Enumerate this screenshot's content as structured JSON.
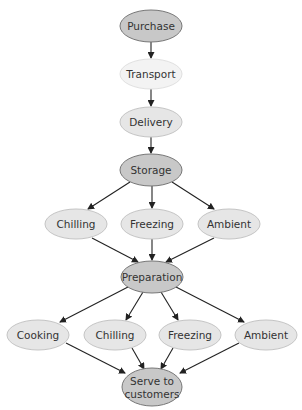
{
  "diagram": {
    "colors": {
      "dark_fill": "#c8c8c8",
      "light_fill": "#e6e6e6",
      "pale_fill": "#f3f3f3",
      "stroke_dark": "#777777",
      "stroke_light": "#c4c4c4",
      "stroke_pale": "#e0e0e0",
      "arrow": "#222222",
      "text": "#333333"
    },
    "nodes": [
      {
        "id": "purchase",
        "label": "Purchase",
        "cx": 151,
        "cy": 26,
        "rx": 31,
        "ry": 16,
        "style": "dark"
      },
      {
        "id": "transport",
        "label": "Transport",
        "cx": 151,
        "cy": 74,
        "rx": 31,
        "ry": 15,
        "style": "pale"
      },
      {
        "id": "delivery",
        "label": "Delivery",
        "cx": 151,
        "cy": 122,
        "rx": 31,
        "ry": 15,
        "style": "light"
      },
      {
        "id": "storage",
        "label": "Storage",
        "cx": 151,
        "cy": 170,
        "rx": 31,
        "ry": 16,
        "style": "dark"
      },
      {
        "id": "chilling1",
        "label": "Chilling",
        "cx": 76,
        "cy": 224,
        "rx": 31,
        "ry": 15,
        "style": "light"
      },
      {
        "id": "freezing1",
        "label": "Freezing",
        "cx": 152,
        "cy": 224,
        "rx": 31,
        "ry": 15,
        "style": "light"
      },
      {
        "id": "ambient1",
        "label": "Ambient",
        "cx": 229,
        "cy": 224,
        "rx": 31,
        "ry": 15,
        "style": "light"
      },
      {
        "id": "preparation",
        "label": "Preparation",
        "cx": 152,
        "cy": 277,
        "rx": 31,
        "ry": 16,
        "style": "dark"
      },
      {
        "id": "cooking",
        "label": "Cooking",
        "cx": 38,
        "cy": 335,
        "rx": 31,
        "ry": 15,
        "style": "light"
      },
      {
        "id": "chilling2",
        "label": "Chilling",
        "cx": 115,
        "cy": 335,
        "rx": 31,
        "ry": 15,
        "style": "light"
      },
      {
        "id": "freezing2",
        "label": "Freezing",
        "cx": 190,
        "cy": 335,
        "rx": 31,
        "ry": 15,
        "style": "light"
      },
      {
        "id": "ambient2",
        "label": "Ambient",
        "cx": 266,
        "cy": 335,
        "rx": 31,
        "ry": 15,
        "style": "light"
      },
      {
        "id": "serve",
        "label": "Serve to",
        "label2": "customers",
        "cx": 152,
        "cy": 387,
        "rx": 30,
        "ry": 19,
        "style": "dark"
      }
    ],
    "edges": [
      {
        "from": "purchase",
        "to": "transport",
        "x1": 151,
        "y1": 42,
        "x2": 151,
        "y2": 58
      },
      {
        "from": "transport",
        "to": "delivery",
        "x1": 151,
        "y1": 89,
        "x2": 151,
        "y2": 106
      },
      {
        "from": "delivery",
        "to": "storage",
        "x1": 151,
        "y1": 137,
        "x2": 151,
        "y2": 153
      },
      {
        "from": "storage",
        "to": "chilling1",
        "x1": 130,
        "y1": 182,
        "x2": 88,
        "y2": 209
      },
      {
        "from": "storage",
        "to": "freezing1",
        "x1": 152,
        "y1": 186,
        "x2": 152,
        "y2": 208
      },
      {
        "from": "storage",
        "to": "ambient1",
        "x1": 172,
        "y1": 182,
        "x2": 214,
        "y2": 209
      },
      {
        "from": "chilling1",
        "to": "preparation",
        "x1": 92,
        "y1": 238,
        "x2": 138,
        "y2": 262
      },
      {
        "from": "freezing1",
        "to": "preparation",
        "x1": 152,
        "y1": 239,
        "x2": 152,
        "y2": 260
      },
      {
        "from": "ambient1",
        "to": "preparation",
        "x1": 214,
        "y1": 238,
        "x2": 166,
        "y2": 262
      },
      {
        "from": "preparation",
        "to": "cooking",
        "x1": 128,
        "y1": 287,
        "x2": 60,
        "y2": 322
      },
      {
        "from": "preparation",
        "to": "chilling2",
        "x1": 143,
        "y1": 292,
        "x2": 126,
        "y2": 320
      },
      {
        "from": "preparation",
        "to": "freezing2",
        "x1": 161,
        "y1": 292,
        "x2": 178,
        "y2": 320
      },
      {
        "from": "preparation",
        "to": "ambient2",
        "x1": 176,
        "y1": 287,
        "x2": 244,
        "y2": 322
      },
      {
        "from": "cooking",
        "to": "serve",
        "x1": 66,
        "y1": 343,
        "x2": 125,
        "y2": 373
      },
      {
        "from": "chilling2",
        "to": "serve",
        "x1": 132,
        "y1": 348,
        "x2": 144,
        "y2": 369
      },
      {
        "from": "freezing2",
        "to": "serve",
        "x1": 173,
        "y1": 348,
        "x2": 161,
        "y2": 369
      },
      {
        "from": "ambient2",
        "to": "serve",
        "x1": 239,
        "y1": 343,
        "x2": 180,
        "y2": 373
      }
    ]
  }
}
